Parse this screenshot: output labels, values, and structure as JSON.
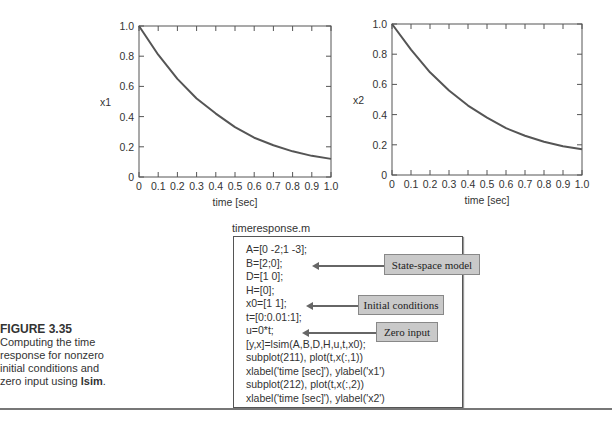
{
  "chart_data": [
    {
      "type": "line",
      "title": "",
      "xlabel": "time [sec]",
      "ylabel": "x1",
      "xlim": [
        0,
        1.0
      ],
      "ylim": [
        0,
        1.0
      ],
      "xticks": [
        "0",
        "0.1",
        "0.2",
        "0.3",
        "0.4",
        "0.5",
        "0.6",
        "0.7",
        "0.8",
        "0.9",
        "1.0"
      ],
      "yticks": [
        "0",
        "0.2",
        "0.4",
        "0.6",
        "0.8",
        "1.0"
      ],
      "grid": false,
      "x": [
        0,
        0.1,
        0.2,
        0.3,
        0.4,
        0.5,
        0.6,
        0.7,
        0.8,
        0.9,
        1.0
      ],
      "series": [
        {
          "name": "x1",
          "values": [
            1.0,
            0.81,
            0.65,
            0.52,
            0.42,
            0.33,
            0.26,
            0.21,
            0.17,
            0.14,
            0.12
          ]
        }
      ]
    },
    {
      "type": "line",
      "title": "",
      "xlabel": "time [sec]",
      "ylabel": "x2",
      "xlim": [
        0,
        1.0
      ],
      "ylim": [
        0,
        1.0
      ],
      "xticks": [
        "0",
        "0.1",
        "0.2",
        "0.3",
        "0.4",
        "0.5",
        "0.6",
        "0.7",
        "0.8",
        "0.9",
        "1.0"
      ],
      "yticks": [
        "0",
        "0.2",
        "0.4",
        "0.6",
        "0.8",
        "1.0"
      ],
      "grid": false,
      "x": [
        0,
        0.1,
        0.2,
        0.3,
        0.4,
        0.5,
        0.6,
        0.7,
        0.8,
        0.9,
        1.0
      ],
      "series": [
        {
          "name": "x2",
          "values": [
            1.0,
            0.83,
            0.68,
            0.56,
            0.46,
            0.38,
            0.31,
            0.26,
            0.22,
            0.19,
            0.17
          ]
        }
      ]
    }
  ],
  "code": {
    "filename": "timeresponse.m",
    "lines": [
      "A=[0 -2;1 -3];",
      "B=[2;0];",
      "D=[1 0];",
      "H=[0];",
      "x0=[1 1];",
      "t=[0:0.01:1];",
      "u=0*t;",
      "[y,x]=lsim(A,B,D,H,u,t,x0);",
      "subplot(211), plot(t,x(:,1))",
      "xlabel('time [sec]'), ylabel('x1')",
      "subplot(212), plot(t,x(:,2))",
      "xlabel('time [sec]'), ylabel('x2')"
    ],
    "callouts": [
      {
        "label": "State-space model"
      },
      {
        "label": "Initial conditions"
      },
      {
        "label": "Zero input"
      }
    ]
  },
  "caption": {
    "figure": "FIGURE 3.35",
    "text_before": "Computing the time response for nonzero initial conditions and zero input using ",
    "bold_word": "lsim",
    "text_after": "."
  }
}
